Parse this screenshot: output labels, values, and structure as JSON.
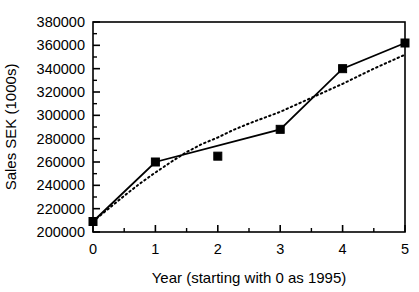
{
  "chart_data": {
    "type": "line",
    "title": "",
    "xlabel": "Year (starting with 0 as 1995)",
    "ylabel": "Sales SEK (1000s)",
    "xlim": [
      0,
      5
    ],
    "ylim": [
      200000,
      380000
    ],
    "x_ticks": [
      "0",
      "1",
      "2",
      "3",
      "4",
      "5"
    ],
    "x_tick_values": [
      0,
      1,
      2,
      3,
      4,
      5
    ],
    "x_minor_tick_values": [
      0.5,
      1.5,
      2.5,
      3.5,
      4.5
    ],
    "y_ticks": [
      "200000",
      "220000",
      "240000",
      "260000",
      "280000",
      "300000",
      "320000",
      "340000",
      "360000",
      "380000"
    ],
    "y_tick_values": [
      200000,
      220000,
      240000,
      260000,
      280000,
      300000,
      320000,
      340000,
      360000,
      380000
    ],
    "y_minor_tick_values": [
      210000,
      230000,
      250000,
      270000,
      290000,
      310000,
      330000,
      350000,
      370000
    ],
    "grid": false,
    "legend": "none",
    "x": [
      0,
      1,
      2,
      3,
      4,
      5
    ],
    "series": [
      {
        "name": "Sales",
        "style": "solid-line-with-square-markers",
        "color": "#000000",
        "marker": "square",
        "values": [
          209000,
          260000,
          265000,
          288000,
          340000,
          362000
        ],
        "line_through_points": [
          {
            "x": 0,
            "y": 209000
          },
          {
            "x": 1,
            "y": 260000
          },
          {
            "x": 3,
            "y": 288000
          },
          {
            "x": 4,
            "y": 340000
          },
          {
            "x": 5,
            "y": 362000
          }
        ]
      },
      {
        "name": "Trend",
        "style": "dotted-curve",
        "color": "#000000",
        "marker": "none",
        "values": [
          209000,
          251000,
          281000,
          303000,
          327000,
          352000
        ],
        "curve_points": [
          {
            "x": 0.0,
            "y": 209000
          },
          {
            "x": 0.25,
            "y": 220000
          },
          {
            "x": 0.5,
            "y": 231000
          },
          {
            "x": 0.75,
            "y": 241500
          },
          {
            "x": 1.0,
            "y": 251000
          },
          {
            "x": 1.25,
            "y": 260000
          },
          {
            "x": 1.5,
            "y": 268500
          },
          {
            "x": 1.75,
            "y": 275500
          },
          {
            "x": 2.0,
            "y": 281000
          },
          {
            "x": 2.25,
            "y": 287500
          },
          {
            "x": 2.5,
            "y": 293000
          },
          {
            "x": 2.75,
            "y": 298000
          },
          {
            "x": 3.0,
            "y": 303000
          },
          {
            "x": 3.25,
            "y": 309000
          },
          {
            "x": 3.5,
            "y": 315000
          },
          {
            "x": 3.75,
            "y": 321000
          },
          {
            "x": 4.0,
            "y": 327000
          },
          {
            "x": 4.25,
            "y": 333500
          },
          {
            "x": 4.5,
            "y": 340000
          },
          {
            "x": 4.75,
            "y": 346000
          },
          {
            "x": 5.0,
            "y": 352000
          }
        ]
      }
    ]
  }
}
